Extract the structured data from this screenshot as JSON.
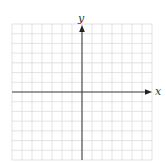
{
  "diagram": {
    "type": "coordinate_plane",
    "axes": {
      "x_label": "x",
      "y_label": "y"
    },
    "grid": {
      "columns": 14,
      "rows": 14,
      "cells_left_of_y_axis": 7,
      "cells_right_of_y_axis": 7,
      "cells_above_x_axis": 7,
      "cells_below_x_axis": 7,
      "line_color": "#dcdcdc",
      "axis_color": "#444444"
    },
    "arrows": [
      "x-positive",
      "y-positive"
    ]
  }
}
